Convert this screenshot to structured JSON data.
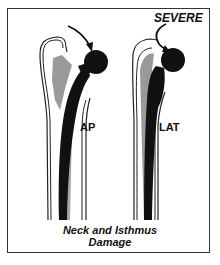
{
  "figure": {
    "labels": {
      "severity": "SEVERE",
      "view_ap": "AP",
      "view_lat": "LAT"
    },
    "caption": {
      "line1": "Neck and Isthmus",
      "line2": "Damage"
    },
    "colors": {
      "implant": "#111111",
      "cement_shadow": "#9a9a9a",
      "outline": "#222222",
      "border": "#333333"
    }
  }
}
